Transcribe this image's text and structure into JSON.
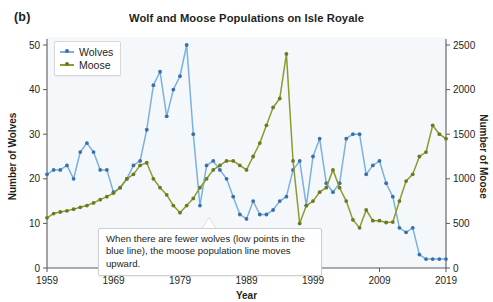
{
  "panel_label": "(b)",
  "callout": {
    "text": "When there are fewer wolves (low points in the blue line), the moose population line moves upward."
  },
  "legend": {
    "items": [
      {
        "label": "Wolves",
        "color": "#7cb0de"
      },
      {
        "label": "Moose",
        "color": "#8d9b2c"
      }
    ]
  },
  "chart_data": {
    "type": "line",
    "title": "Wolf and Moose Populations on Isle Royale",
    "xlabel": "Year",
    "ylabel": "Number of Wolves",
    "y2label": "Number of Moose",
    "xlim": [
      1959,
      2019
    ],
    "ylim": [
      0,
      50
    ],
    "y2lim": [
      0,
      2500
    ],
    "xticks": [
      1959,
      1969,
      1979,
      1989,
      1999,
      2009,
      2019
    ],
    "yticks": [
      0,
      10,
      20,
      30,
      40,
      50
    ],
    "y2ticks": [
      0,
      500,
      1000,
      1500,
      2000,
      2500
    ],
    "grid": false,
    "legend_position": "top-left",
    "x": [
      1959,
      1960,
      1961,
      1962,
      1963,
      1964,
      1965,
      1966,
      1967,
      1968,
      1969,
      1970,
      1971,
      1972,
      1973,
      1974,
      1975,
      1976,
      1977,
      1978,
      1979,
      1980,
      1981,
      1982,
      1983,
      1984,
      1985,
      1986,
      1987,
      1988,
      1989,
      1990,
      1991,
      1992,
      1993,
      1994,
      1995,
      1996,
      1997,
      1998,
      1999,
      2000,
      2001,
      2002,
      2003,
      2004,
      2005,
      2006,
      2007,
      2008,
      2009,
      2010,
      2011,
      2012,
      2013,
      2014,
      2015,
      2016,
      2017,
      2018,
      2019
    ],
    "series": [
      {
        "name": "Wolves",
        "axis": "left",
        "color": "#7cb0de",
        "marker_color": "#3b6fa8",
        "values": [
          21,
          22,
          22,
          23,
          20,
          26,
          28,
          26,
          22,
          22,
          17,
          18,
          20,
          23,
          24,
          31,
          41,
          44,
          34,
          40,
          43,
          50,
          30,
          14,
          23,
          24,
          22,
          20,
          16,
          12,
          11,
          15,
          12,
          12,
          13,
          15,
          16,
          22,
          24,
          14,
          25,
          29,
          19,
          17,
          19,
          29,
          30,
          30,
          21,
          23,
          24,
          19,
          16,
          9,
          8,
          9,
          3,
          2,
          2,
          2,
          2
        ]
      },
      {
        "name": "Moose",
        "axis": "right",
        "color": "#8d9b2c",
        "marker_color": "#6b7a1e",
        "values": [
          563,
          610,
          628,
          641,
          660,
          680,
          700,
          730,
          766,
          800,
          840,
          900,
          1000,
          1050,
          1150,
          1180,
          1000,
          900,
          820,
          700,
          620,
          700,
          780,
          900,
          1000,
          1100,
          1150,
          1200,
          1200,
          1150,
          1100,
          1250,
          1400,
          1600,
          1800,
          1900,
          2400,
          1200,
          500,
          700,
          750,
          850,
          900,
          1100,
          900,
          750,
          540,
          450,
          650,
          530,
          530,
          510,
          515,
          750,
          975,
          1050,
          1250,
          1300,
          1600,
          1500,
          1450
        ]
      }
    ],
    "annotation": "When there are fewer wolves (low points in the blue line), the moose population line moves upward."
  }
}
